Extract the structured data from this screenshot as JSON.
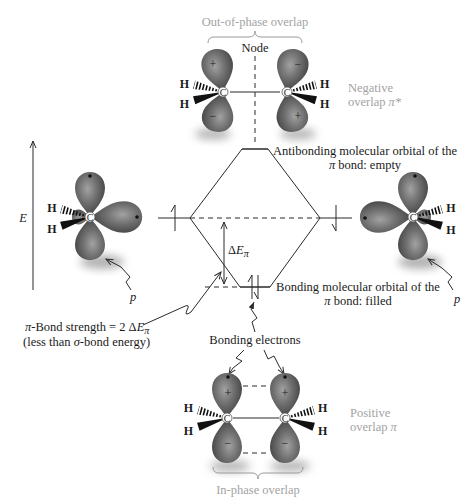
{
  "figure": {
    "top_pair": {
      "caption": "Out-of-phase overlap",
      "node_label": "Node",
      "side_label_line1": "Negative",
      "side_label_line2_prefix": "overlap ",
      "side_label_line2_symbol": "π*"
    },
    "energy_axis": {
      "label": "E"
    },
    "antibonding_label": {
      "line1": "Antibonding molecular orbital of the",
      "line2_symbol": "π",
      "line2_rest": " bond: empty"
    },
    "bonding_label": {
      "line1": "Bonding molecular orbital of the",
      "line2_symbol": "π",
      "line2_rest": " bond: filled"
    },
    "delta_label": {
      "delta": "Δ",
      "e": "E",
      "sub": "π"
    },
    "p_label": "p",
    "bond_strength": {
      "pi": "π",
      "text": "-Bond strength = 2 Δ",
      "e": "E",
      "sub": "π",
      "line2_open": "(less than ",
      "sigma": "σ",
      "line2_rest": "-bond energy)"
    },
    "bonding_electrons_label": "Bonding electrons",
    "bottom_pair": {
      "caption": "In-phase overlap",
      "side_label_line1": "Positive",
      "side_label_line2_prefix": "overlap ",
      "side_label_line2_symbol": "π"
    },
    "atoms": {
      "carbon": "C",
      "hydrogen": "H"
    },
    "signs": {
      "plus": "+",
      "minus": "−"
    }
  },
  "colors": {
    "lobe_light": "#a2a2a2",
    "lobe_mid": "#6f6f6f",
    "lobe_dark": "#3c3c3c",
    "caption_gray": "#a3a3a3",
    "line": "#2a2a2a"
  }
}
